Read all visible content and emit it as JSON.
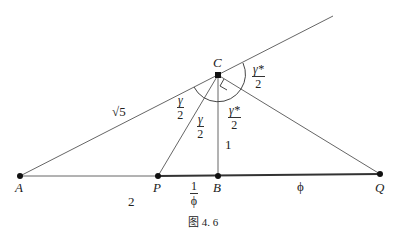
{
  "diagram": {
    "points": {
      "A": {
        "label": "A",
        "x": 20,
        "y": 176
      },
      "P": {
        "label": "P",
        "x": 158,
        "y": 176
      },
      "B": {
        "label": "B",
        "x": 218,
        "y": 176
      },
      "Q": {
        "label": "Q",
        "x": 380,
        "y": 174
      },
      "C": {
        "label": "C",
        "x": 218,
        "y": 75
      }
    },
    "segment_labels": {
      "AC": "√5",
      "AP": "2",
      "CB": "1",
      "PB_num": "1",
      "PB_den": "ϕ",
      "BQ": "ϕ"
    },
    "angle_labels": [
      {
        "id": "gamma_half_left",
        "num": "γ",
        "den": "2"
      },
      {
        "id": "gamma_half_mid",
        "num": "γ",
        "den": "2"
      },
      {
        "id": "gamma_star_half_inner",
        "num": "γ*",
        "den": "2"
      },
      {
        "id": "gamma_star_half_outer",
        "num": "γ*",
        "den": "2"
      }
    ],
    "caption": "图 4. 6"
  }
}
